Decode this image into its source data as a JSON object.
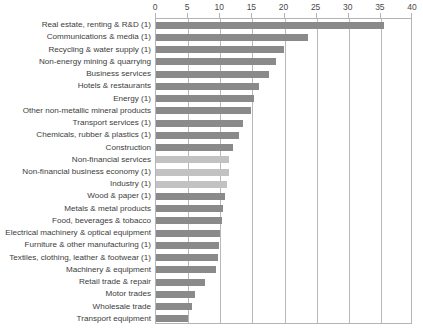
{
  "chart_data": {
    "type": "bar",
    "orientation": "horizontal",
    "title": "",
    "xlabel": "",
    "ylabel": "",
    "xlim": [
      0,
      40
    ],
    "xticks": [
      0,
      5,
      10,
      15,
      20,
      25,
      30,
      35,
      40
    ],
    "grid": true,
    "legend": "none",
    "colors": {
      "bar_dark": "#8a8a8a",
      "bar_light": "#c2c2c2",
      "gridline": "#b8b8b8",
      "axis_border": "#b4b4b4",
      "text": "#3c3c3c",
      "background": "#ffffff"
    },
    "categories": [
      "Real estate, renting & R&D (1)",
      "Communications & media (1)",
      "Recycling & water supply (1)",
      "Non-energy mining & quarrying",
      "Business services",
      "Hotels & restaurants",
      "Energy (1)",
      "Other non-metallic mineral products",
      "Transport services (1)",
      "Chemicals, rubber & plastics (1)",
      "Construction",
      "Non-financial services",
      "Non-financial business economy (1)",
      "Industry (1)",
      "Wood & paper (1)",
      "Metals & metal products",
      "Food, beverages & tobacco",
      "Electrical machinery & optical equipment",
      "Furniture & other manufacturing (1)",
      "Textiles, clothing, leather & footwear (1)",
      "Machinery & equipment",
      "Retail trade & repair",
      "Motor trades",
      "Wholesale trade",
      "Transport equipment"
    ],
    "values": [
      35.5,
      23.6,
      19.9,
      18.6,
      17.6,
      16.0,
      15.3,
      14.8,
      13.5,
      12.9,
      12.0,
      11.4,
      11.3,
      11.1,
      10.7,
      10.5,
      10.3,
      10.0,
      9.8,
      9.7,
      9.3,
      7.6,
      6.1,
      5.6,
      5.0
    ],
    "series_shades": [
      "dark",
      "dark",
      "dark",
      "dark",
      "dark",
      "dark",
      "dark",
      "dark",
      "dark",
      "dark",
      "dark",
      "light",
      "light",
      "light",
      "dark",
      "dark",
      "dark",
      "dark",
      "dark",
      "dark",
      "dark",
      "dark",
      "dark",
      "dark",
      "dark"
    ]
  }
}
